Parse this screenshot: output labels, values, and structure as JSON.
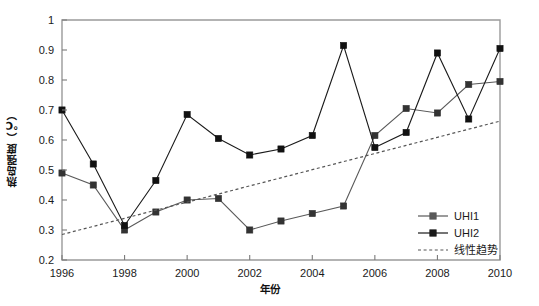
{
  "chart_data": {
    "type": "line",
    "title": "",
    "subtitle": "",
    "xlabel": "年份",
    "ylabel": "热岛强度（℃）",
    "x": [
      1996,
      1997,
      1998,
      1999,
      2000,
      2001,
      2002,
      2003,
      2004,
      2005,
      2006,
      2007,
      2008,
      2009,
      2010
    ],
    "xlim": [
      1996,
      2010
    ],
    "ylim": [
      0.2,
      1.0
    ],
    "xticks": [
      1996,
      1998,
      2000,
      2002,
      2004,
      2006,
      2008,
      2010
    ],
    "xtick_labels": [
      "1996",
      "1998",
      "2000",
      "2002",
      "2004",
      "2006",
      "2008",
      "2010"
    ],
    "yticks": [
      0.2,
      0.3,
      0.4,
      0.5,
      0.6,
      0.7,
      0.8,
      0.9,
      1.0
    ],
    "ytick_labels": [
      "0.2",
      "0.3",
      "0.4",
      "0.5",
      "0.6",
      "0.7",
      "0.8",
      "0.9",
      "1"
    ],
    "grid": false,
    "legend_position": "bottom-right",
    "series": [
      {
        "name": "UHI1",
        "color": "#595959",
        "marker": "square",
        "marker_color": "#333333",
        "linestyle": "solid",
        "values": [
          0.49,
          0.45,
          0.3,
          0.36,
          0.4,
          0.405,
          0.3,
          0.33,
          0.355,
          0.38,
          0.615,
          0.705,
          0.69,
          0.785,
          0.795
        ]
      },
      {
        "name": "UHI2",
        "color": "#1a1a1a",
        "marker": "square",
        "marker_color": "#111111",
        "linestyle": "solid",
        "values": [
          0.7,
          0.52,
          0.315,
          0.465,
          0.685,
          0.605,
          0.55,
          0.57,
          0.615,
          0.915,
          0.575,
          0.625,
          0.89,
          0.67,
          0.905
        ]
      },
      {
        "name": "线性趋势",
        "color": "#555555",
        "marker": "none",
        "linestyle": "dotted",
        "values": [
          0.285,
          0.312,
          0.339,
          0.366,
          0.393,
          0.42,
          0.447,
          0.474,
          0.501,
          0.528,
          0.555,
          0.582,
          0.609,
          0.636,
          0.663
        ]
      }
    ],
    "legend": [
      {
        "label": "UHI1",
        "color": "#595959",
        "marker": "square",
        "style": "solid"
      },
      {
        "label": "UHI2",
        "color": "#1a1a1a",
        "marker": "square",
        "style": "solid"
      },
      {
        "label": "线性趋势",
        "color": "#555555",
        "marker": "none",
        "style": "dotted"
      }
    ]
  }
}
